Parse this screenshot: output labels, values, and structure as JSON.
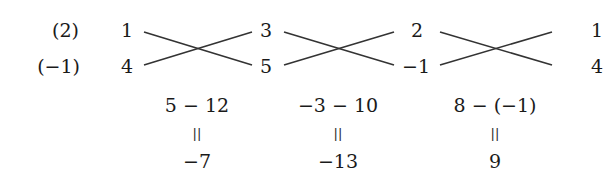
{
  "row_labels": [
    "(2)",
    "(−1)"
  ],
  "columns": [
    {
      "top": "1",
      "bottom": "4"
    },
    {
      "top": "3",
      "bottom": "5"
    },
    {
      "top": "2",
      "bottom": "−1"
    },
    {
      "top": "1",
      "bottom": "4"
    }
  ],
  "results": [
    {
      "expression": "5 − 12",
      "equals": "||",
      "value": "−7"
    },
    {
      "expression": "−3 − 10",
      "equals": "||",
      "value": "−13"
    },
    {
      "expression": "8 − (−1)",
      "equals": "||",
      "value": "9"
    }
  ],
  "colors": {
    "ink": "#1a1a1a",
    "line": "#333333",
    "background": "#ffffff"
  }
}
